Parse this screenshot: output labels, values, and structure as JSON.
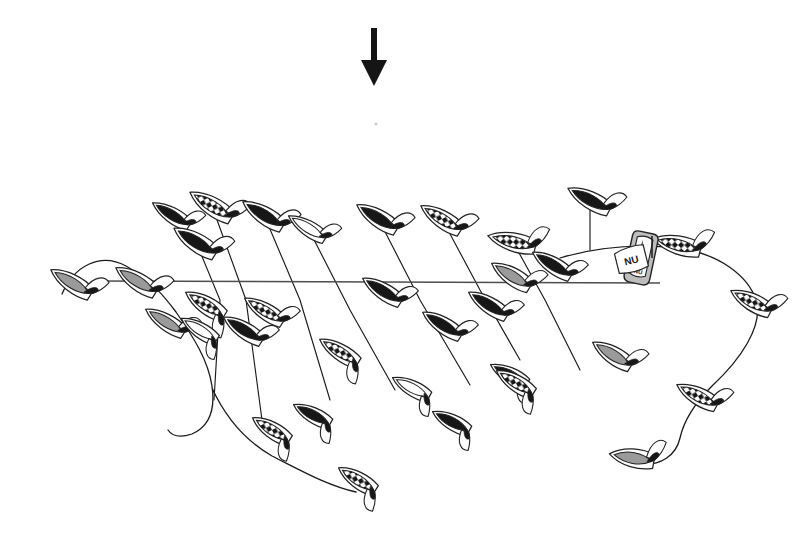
{
  "figure": {
    "background_color": "#ffffff",
    "width": 809,
    "height": 542
  },
  "palette": {
    "ink": "#1a1a1a",
    "outline": "#222222",
    "hull_black": "#171717",
    "hull_gray": "#9a9a9a",
    "hull_white": "#ffffff",
    "check_dark": "#161616",
    "check_light": "#ffffff",
    "line_gray": "#4d4d4d",
    "sail_white": "#fdfdfd"
  },
  "wind_arrow": {
    "name": "wind-direction-arrow",
    "label": "",
    "x": 374,
    "y_top": 28,
    "y_bottom": 86,
    "shaft_width": 6,
    "head_width": 26,
    "head_height": 26,
    "direction": "down",
    "color": "#151515"
  },
  "speck": {
    "x": 376,
    "y": 124,
    "r": 1.6,
    "color": "#cfcfcf"
  },
  "start_line": {
    "name": "start-line",
    "x1": 95,
    "y1": 281,
    "x2": 660,
    "y2": 283,
    "color": "#4d4d4d",
    "width": 1.4
  },
  "committee_boat": {
    "name": "committee-boat",
    "x": 641,
    "y": 258,
    "width": 26,
    "height": 52,
    "rotation": 12,
    "fill": "#bdbdbd",
    "flag": {
      "text": "NU",
      "x": 614,
      "y": 252,
      "w": 30,
      "h": 22,
      "rotation": -14,
      "fill": "#ffffff"
    },
    "hull_badge": {
      "text": "NU"
    },
    "mast": {
      "x": 652,
      "y_top": 236,
      "y_bottom": 258
    }
  },
  "course_path": {
    "name": "fleet-course-path",
    "description": "continuous thin line threading the fleet",
    "d": "M 62 296 C 70 272 96 254 122 266 C 146 277 162 290 176 306 C 196 330 206 352 210 380 C 214 408 206 424 192 432 C 178 440 172 438 168 430"
  },
  "boats": [
    {
      "id": 1,
      "name": "boat-1",
      "x": 72,
      "y": 283,
      "angle": -58,
      "len": 50,
      "w": 17,
      "fill": "gray",
      "sail": "white",
      "sail_side": "right"
    },
    {
      "id": 2,
      "name": "boat-2",
      "x": 137,
      "y": 281,
      "angle": -58,
      "len": 50,
      "w": 17,
      "fill": "gray",
      "sail": "white",
      "sail_side": "right"
    },
    {
      "id": 3,
      "name": "boat-3",
      "x": 166,
      "y": 322,
      "angle": -58,
      "len": 48,
      "w": 16,
      "fill": "gray",
      "sail": "white",
      "sail_side": "right"
    },
    {
      "id": 4,
      "name": "boat-4",
      "x": 172,
      "y": 215,
      "angle": -58,
      "len": 46,
      "w": 15,
      "fill": "black",
      "sail": "white",
      "sail_side": "right"
    },
    {
      "id": 5,
      "name": "boat-5",
      "x": 196,
      "y": 242,
      "angle": -58,
      "len": 52,
      "w": 18,
      "fill": "black",
      "sail": "white",
      "sail_side": "right"
    },
    {
      "id": 6,
      "name": "boat-6",
      "x": 212,
      "y": 206,
      "angle": -58,
      "len": 52,
      "w": 18,
      "fill": "check",
      "sail": "white",
      "sail_side": "right"
    },
    {
      "id": 7,
      "name": "boat-7",
      "x": 206,
      "y": 305,
      "angle": -58,
      "len": 48,
      "w": 17,
      "fill": "check",
      "sail": "white",
      "sail_side": "left"
    },
    {
      "id": 8,
      "name": "boat-8",
      "x": 200,
      "y": 330,
      "angle": -58,
      "len": 44,
      "w": 15,
      "fill": "white",
      "sail": "white",
      "sail_side": "left"
    },
    {
      "id": 9,
      "name": "boat-9",
      "x": 244,
      "y": 330,
      "angle": -58,
      "len": 48,
      "w": 16,
      "fill": "black",
      "sail": "white",
      "sail_side": "right"
    },
    {
      "id": 10,
      "name": "boat-10",
      "x": 264,
      "y": 215,
      "angle": -58,
      "len": 50,
      "w": 17,
      "fill": "black",
      "sail": "white",
      "sail_side": "right"
    },
    {
      "id": 11,
      "name": "boat-11",
      "x": 265,
      "y": 311,
      "angle": -58,
      "len": 48,
      "w": 16,
      "fill": "check",
      "sail": "white",
      "sail_side": "right"
    },
    {
      "id": 12,
      "name": "boat-12",
      "x": 272,
      "y": 430,
      "angle": -58,
      "len": 46,
      "w": 16,
      "fill": "check",
      "sail": "white",
      "sail_side": "left"
    },
    {
      "id": 13,
      "name": "boat-13",
      "x": 308,
      "y": 228,
      "angle": -58,
      "len": 46,
      "w": 15,
      "fill": "white",
      "sail": "white",
      "sail_side": "right"
    },
    {
      "id": 14,
      "name": "boat-14",
      "x": 313,
      "y": 415,
      "angle": -62,
      "len": 44,
      "w": 15,
      "fill": "black",
      "sail": "white",
      "sail_side": "left"
    },
    {
      "id": 15,
      "name": "boat-15",
      "x": 340,
      "y": 352,
      "angle": -58,
      "len": 48,
      "w": 16,
      "fill": "check",
      "sail": "white",
      "sail_side": "left"
    },
    {
      "id": 16,
      "name": "boat-16",
      "x": 358,
      "y": 480,
      "angle": -58,
      "len": 46,
      "w": 16,
      "fill": "check",
      "sail": "white",
      "sail_side": "left"
    },
    {
      "id": 17,
      "name": "boat-17",
      "x": 378,
      "y": 218,
      "angle": -58,
      "len": 50,
      "w": 17,
      "fill": "black",
      "sail": "white",
      "sail_side": "right"
    },
    {
      "id": 18,
      "name": "boat-18",
      "x": 383,
      "y": 291,
      "angle": -58,
      "len": 48,
      "w": 16,
      "fill": "black",
      "sail": "white",
      "sail_side": "right"
    },
    {
      "id": 19,
      "name": "boat-19",
      "x": 412,
      "y": 388,
      "angle": -62,
      "len": 44,
      "w": 15,
      "fill": "white",
      "sail": "white",
      "sail_side": "left"
    },
    {
      "id": 20,
      "name": "boat-20",
      "x": 443,
      "y": 325,
      "angle": -58,
      "len": 48,
      "w": 16,
      "fill": "black",
      "sail": "white",
      "sail_side": "right"
    },
    {
      "id": 21,
      "name": "boat-21",
      "x": 452,
      "y": 422,
      "angle": -62,
      "len": 44,
      "w": 15,
      "fill": "black",
      "sail": "white",
      "sail_side": "left"
    },
    {
      "id": 22,
      "name": "boat-22",
      "x": 442,
      "y": 219,
      "angle": -58,
      "len": 50,
      "w": 17,
      "fill": "check",
      "sail": "white",
      "sail_side": "right"
    },
    {
      "id": 23,
      "name": "boat-23",
      "x": 489,
      "y": 305,
      "angle": -58,
      "len": 48,
      "w": 16,
      "fill": "black",
      "sail": "white",
      "sail_side": "right"
    },
    {
      "id": 24,
      "name": "boat-24",
      "x": 510,
      "y": 375,
      "angle": -62,
      "len": 44,
      "w": 15,
      "fill": "black",
      "sail": "white",
      "sail_side": "left"
    },
    {
      "id": 25,
      "name": "boat-25",
      "x": 513,
      "y": 242,
      "angle": -76,
      "len": 52,
      "w": 18,
      "fill": "check",
      "sail": "white",
      "sail_side": "right"
    },
    {
      "id": 26,
      "name": "boat-26",
      "x": 512,
      "y": 276,
      "angle": -58,
      "len": 48,
      "w": 17,
      "fill": "gray",
      "sail": "white",
      "sail_side": "right"
    },
    {
      "id": 27,
      "name": "boat-27",
      "x": 553,
      "y": 265,
      "angle": -58,
      "len": 48,
      "w": 16,
      "fill": "black",
      "sail": "white",
      "sail_side": "right"
    },
    {
      "id": 28,
      "name": "boat-28",
      "x": 516,
      "y": 383,
      "angle": -58,
      "len": 46,
      "w": 16,
      "fill": "check",
      "sail": "white",
      "sail_side": "left"
    },
    {
      "id": 29,
      "name": "boat-29",
      "x": 590,
      "y": 200,
      "angle": -62,
      "len": 50,
      "w": 17,
      "fill": "black",
      "sail": "white",
      "sail_side": "right"
    },
    {
      "id": 30,
      "name": "boat-30",
      "x": 613,
      "y": 355,
      "angle": -58,
      "len": 48,
      "w": 17,
      "fill": "gray",
      "sail": "white",
      "sail_side": "right"
    },
    {
      "id": 31,
      "name": "boat-31",
      "x": 678,
      "y": 245,
      "angle": -76,
      "len": 52,
      "w": 18,
      "fill": "check",
      "sail": "white",
      "sail_side": "right"
    },
    {
      "id": 32,
      "name": "boat-32",
      "x": 752,
      "y": 302,
      "angle": -62,
      "len": 48,
      "w": 17,
      "fill": "check",
      "sail": "white",
      "sail_side": "right"
    },
    {
      "id": 33,
      "name": "boat-33",
      "x": 698,
      "y": 396,
      "angle": -62,
      "len": 48,
      "w": 17,
      "fill": "check",
      "sail": "white",
      "sail_side": "right"
    },
    {
      "id": 34,
      "name": "boat-34",
      "x": 633,
      "y": 458,
      "angle": -80,
      "len": 48,
      "w": 18,
      "fill": "gray",
      "sail": "white",
      "sail_side": "right"
    }
  ],
  "rodes": [
    {
      "name": "rode-1",
      "d": "M 196 242 L 220 300 L 214 400"
    },
    {
      "name": "rode-2",
      "d": "M 212 206 L 246 300 L 262 420"
    },
    {
      "name": "rode-3",
      "d": "M 264 215 L 300 300 L 330 400"
    },
    {
      "name": "rode-4",
      "d": "M 308 228 L 350 310 L 395 390"
    },
    {
      "name": "rode-5",
      "d": "M 378 218 L 420 300 L 470 385"
    },
    {
      "name": "rode-6",
      "d": "M 442 219 L 480 290 L 520 360"
    },
    {
      "name": "rode-7",
      "d": "M 513 242 L 545 300 L 580 370"
    },
    {
      "name": "rode-8",
      "d": "M 590 200 L 590 250"
    }
  ],
  "fleet_chain": {
    "name": "fleet-chain-line",
    "d": "M 62 294 C 74 266 100 252 126 266 C 152 281 164 296 176 312 C 194 338 208 360 212 386 C 216 414 206 428 192 434 C 180 438 172 436 168 430 M 212 388 C 224 414 244 440 272 456 C 300 470 328 486 356 492 M 560 258 C 600 246 640 244 678 248 C 720 254 748 276 756 300 C 764 326 740 360 712 386 C 696 402 684 420 680 438 C 676 456 660 466 640 464"
  },
  "meta_labels": {
    "wind_arrow_name": "wind-direction-arrow",
    "start_line_name": "start-line",
    "committee_boat_name": "committee-boat",
    "fleet_name": "sailboat-fleet"
  }
}
